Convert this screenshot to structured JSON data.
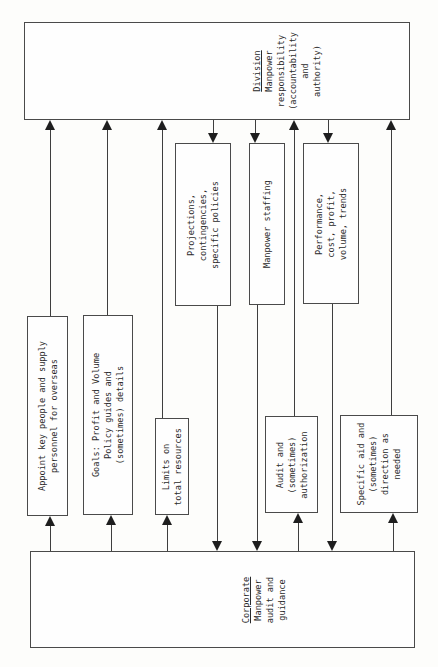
{
  "division_box": {
    "title": "Division",
    "lines": [
      "Manpower",
      "responsibility",
      "(accountability",
      "and",
      "authority)"
    ]
  },
  "corporate_box": {
    "title": "Corporate",
    "lines": [
      "Manpower",
      "audit and",
      "guidance"
    ]
  },
  "flows_up_to_division": [
    {
      "lines": [
        "Appoint key people and supply",
        "personnel for overseas"
      ]
    },
    {
      "lines": [
        "Goals: Profit and Volume",
        "Policy guides and",
        "(sometimes) details"
      ]
    },
    {
      "lines": [
        "Limits on",
        "total resources"
      ]
    },
    {
      "lines": [
        "Audit and",
        "(sometimes)",
        "authorization"
      ]
    },
    {
      "lines": [
        "Specific aid and",
        "(sometimes)",
        "direction as",
        "needed"
      ]
    }
  ],
  "flows_down_to_corporate": [
    {
      "lines": [
        "Projections,",
        "contingencies,",
        "specific policies"
      ]
    },
    {
      "lines": [
        "Manpower staffing"
      ]
    },
    {
      "lines": [
        "Performance,",
        "cost, profit,",
        "volume, trends"
      ]
    }
  ]
}
